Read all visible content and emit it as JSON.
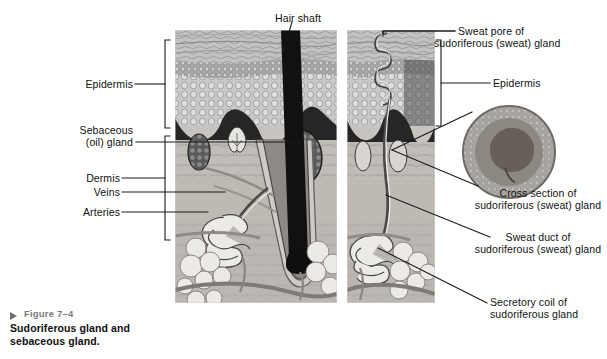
{
  "figure": {
    "number": "Figure 7–4",
    "title_line1": "Sudoriferous gland and",
    "title_line2": "sebaceous gland.",
    "marker": "triangle-right-icon"
  },
  "labels_left": [
    {
      "id": "epidermis",
      "text": "Epidermis"
    },
    {
      "id": "sebaceous",
      "line1": "Sebaceous",
      "line2": "(oil) gland"
    },
    {
      "id": "dermis",
      "text": "Dermis"
    },
    {
      "id": "veins",
      "text": "Veins"
    },
    {
      "id": "arteries",
      "text": "Arteries"
    }
  ],
  "labels_top": [
    {
      "id": "hair-shaft",
      "text": "Hair shaft"
    }
  ],
  "labels_right": [
    {
      "id": "sweat-pore",
      "line1": "Sweat pore of",
      "line2": "sudoriferous (sweat) gland"
    },
    {
      "id": "epidermis-right",
      "line1": "Epidermis",
      "line2": ""
    },
    {
      "id": "cross-section",
      "line1": "Cross section of",
      "line2": "sudoriferous (sweat) gland"
    },
    {
      "id": "sweat-duct",
      "line1": "Sweat duct of",
      "line2": "sudoriferous (sweat) gland"
    },
    {
      "id": "secretory-coil",
      "line1": "Secretory coil of",
      "line2": "sudoriferous gland"
    }
  ],
  "panels": [
    {
      "id": "panel-hair-sebaceous",
      "name": "skin cross-section with hair follicle and sebaceous gland"
    },
    {
      "id": "panel-sweat-gland",
      "name": "skin cross-section with sudoriferous gland"
    }
  ],
  "inset": {
    "id": "gland-cross-section",
    "name": "circular cross section of sweat gland"
  },
  "colors": {
    "leader": "#1a1a1a",
    "caption_gray": "#7b7b7b",
    "text": "#111111",
    "stratum_corneum": "#b9b9b9",
    "stratum_granulosum": "#8f8f8f",
    "stratum_spinosum": "#c8c8c8",
    "basal_dark": "#2e2e2e",
    "dermis_upper": "#c4c4c4",
    "dermis_lower": "#b0aaa6",
    "hypodermis": "#a9a29e",
    "adipose": "#e8e6e3",
    "hair": "#111111",
    "vessel": "#8a8580"
  }
}
